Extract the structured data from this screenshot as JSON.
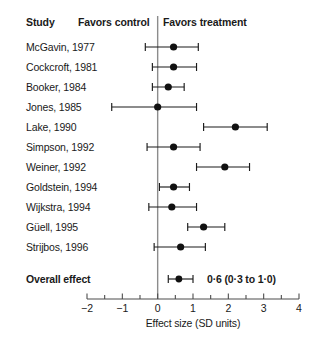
{
  "header": {
    "study": "Study",
    "favors_control": "Favors control",
    "favors_treatment": "Favors treatment"
  },
  "axis": {
    "caption": "Effect size (SD units)",
    "tick_labels": [
      "−2",
      "−1",
      "0",
      "1",
      "2",
      "3",
      "4"
    ],
    "tick_values": [
      -2,
      -1,
      0,
      1,
      2,
      3,
      4
    ],
    "minor_step": 0.5,
    "min": -2,
    "max": 4,
    "null_value": 0
  },
  "overall": {
    "label": "Overall effect",
    "value_text": "0·6 (0·3 to 1·0)",
    "estimate": 0.6,
    "ci_low": 0.3,
    "ci_high": 1.0
  },
  "colors": {
    "marker": "#111111",
    "ci": "#1a1a1a",
    "zero_line": "#8c8c8c",
    "axis": "#4d4d4d",
    "text": "#1a1a1a",
    "background": "#ffffff"
  },
  "chart_data": {
    "type": "scatter",
    "title": "",
    "subtitle": "",
    "xlabel": "Effect size (SD units)",
    "ylabel": "Study",
    "xlim": [
      -2,
      4
    ],
    "grid": false,
    "legend": "none",
    "annotations": [
      "Favors control",
      "Favors treatment",
      "0·6 (0·3 to 1·0)"
    ],
    "null_line": 0,
    "categories": [
      "McGavin, 1977",
      "Cockcroft, 1981",
      "Booker, 1984",
      "Jones, 1985",
      "Lake, 1990",
      "Simpson, 1992",
      "Weiner, 1992",
      "Goldstein, 1994",
      "Wijkstra, 1994",
      "Güell, 1995",
      "Strijbos, 1996",
      "Overall effect"
    ],
    "values": [
      0.45,
      0.45,
      0.3,
      0.0,
      2.2,
      0.45,
      1.9,
      0.45,
      0.4,
      1.3,
      0.65,
      0.6
    ],
    "points": [
      {
        "study": "McGavin, 1977",
        "estimate": 0.45,
        "ci_low": -0.35,
        "ci_high": 1.15,
        "overall": false
      },
      {
        "study": "Cockcroft, 1981",
        "estimate": 0.45,
        "ci_low": -0.15,
        "ci_high": 1.1,
        "overall": false
      },
      {
        "study": "Booker, 1984",
        "estimate": 0.3,
        "ci_low": -0.15,
        "ci_high": 0.75,
        "overall": false
      },
      {
        "study": "Jones, 1985",
        "estimate": 0.0,
        "ci_low": -1.3,
        "ci_high": 1.1,
        "overall": false
      },
      {
        "study": "Lake, 1990",
        "estimate": 2.2,
        "ci_low": 1.3,
        "ci_high": 3.1,
        "overall": false
      },
      {
        "study": "Simpson, 1992",
        "estimate": 0.45,
        "ci_low": -0.3,
        "ci_high": 1.2,
        "overall": false
      },
      {
        "study": "Weiner, 1992",
        "estimate": 1.9,
        "ci_low": 1.1,
        "ci_high": 2.6,
        "overall": false
      },
      {
        "study": "Goldstein, 1994",
        "estimate": 0.45,
        "ci_low": 0.05,
        "ci_high": 0.9,
        "overall": false
      },
      {
        "study": "Wijkstra, 1994",
        "estimate": 0.4,
        "ci_low": -0.25,
        "ci_high": 1.1,
        "overall": false
      },
      {
        "study": "Güell, 1995",
        "estimate": 1.3,
        "ci_low": 0.85,
        "ci_high": 1.9,
        "overall": false
      },
      {
        "study": "Strijbos, 1996",
        "estimate": 0.65,
        "ci_low": -0.1,
        "ci_high": 1.35,
        "overall": false
      },
      {
        "study": "Overall effect",
        "estimate": 0.6,
        "ci_low": 0.3,
        "ci_high": 1.0,
        "overall": true
      }
    ]
  }
}
